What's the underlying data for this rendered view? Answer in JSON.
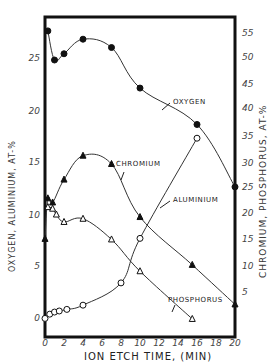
{
  "chart_data": {
    "type": "line",
    "title": "",
    "xlabel": "Ion Etch Time, (min)",
    "ylabel_left": "Oxygen, Aluminium, At-%",
    "ylabel_right": "Chromium, Phosphorus, At-%",
    "xlim": [
      0,
      20
    ],
    "ylim_left": [
      0,
      29
    ],
    "ylim_right": [
      0,
      57
    ],
    "x_ticks": [
      "0",
      "2",
      "4",
      "6",
      "8",
      "10",
      "12",
      "14",
      "16",
      "18",
      "20"
    ],
    "y_ticks_left": [
      "0",
      "5",
      "10",
      "15",
      "20",
      "25"
    ],
    "y_ticks_right": [
      "5",
      "10",
      "15",
      "20",
      "25",
      "30",
      "35",
      "40",
      "45",
      "50",
      "55"
    ],
    "grid": false,
    "legend": "inline labels",
    "series": [
      {
        "name": "Oxygen",
        "axis": "left",
        "marker": "filled-circle",
        "x": [
          0.3,
          1,
          2,
          4,
          7,
          10,
          16,
          20
        ],
        "y": [
          27.8,
          25.0,
          25.6,
          27.0,
          26.2,
          22.3,
          18.8,
          12.8
        ]
      },
      {
        "name": "Aluminium",
        "axis": "left",
        "marker": "filled-triangle",
        "x": [
          0,
          0.3,
          0.8,
          2,
          4,
          7,
          10,
          15.5,
          20
        ],
        "y": [
          7.8,
          11.7,
          11.3,
          13.5,
          15.8,
          15.0,
          9.9,
          5.3,
          1.5
        ]
      },
      {
        "name": "Chromium",
        "axis": "right",
        "marker": "open-triangle",
        "x": [
          0.3,
          0.8,
          1.2,
          2,
          4,
          7,
          10,
          15.5
        ],
        "y": [
          21.3,
          21.0,
          19.9,
          18.5,
          19.1,
          15.2,
          9.2,
          0.2
        ]
      },
      {
        "name": "Phosphorus",
        "axis": "right",
        "marker": "open-circle",
        "x": [
          0,
          0.5,
          1,
          1.5,
          2.3,
          4,
          8,
          10,
          16
        ],
        "y": [
          0.3,
          1.1,
          1.5,
          1.7,
          2.0,
          2.8,
          7.0,
          15.4,
          34.3
        ]
      }
    ],
    "annotations": [
      "Oxygen",
      "Chromium",
      "Aluminium",
      "Phosphorus"
    ]
  },
  "labels": {
    "oxygen": "OXYGEN",
    "chromium": "CHROMIUM",
    "aluminium": "ALUMINIUM",
    "phosphorus": "PHOSPHORUS",
    "xlabel": "ION ETCH TIME, (MIN)",
    "ylabel_left": "OXYGEN, ALUMINIUM, AT-%",
    "ylabel_right": "CHROMIUM, PHOSPHORUS, AT-%"
  },
  "ticks": {
    "x": [
      {
        "label": "0",
        "px": 45
      },
      {
        "label": "2",
        "px": 64
      },
      {
        "label": "4",
        "px": 83
      },
      {
        "label": "6",
        "px": 102
      },
      {
        "label": "8",
        "px": 121
      },
      {
        "label": "10",
        "px": 140
      },
      {
        "label": "12",
        "px": 159
      },
      {
        "label": "14",
        "px": 178
      },
      {
        "label": "16",
        "px": 197
      },
      {
        "label": "18",
        "px": 216
      },
      {
        "label": "20",
        "px": 235
      }
    ],
    "left": [
      {
        "label": "25",
        "py": 59
      },
      {
        "label": "20",
        "py": 112
      },
      {
        "label": "15",
        "py": 163
      },
      {
        "label": "10",
        "py": 216
      },
      {
        "label": "5",
        "py": 267
      },
      {
        "label": "0",
        "py": 319
      }
    ],
    "right": [
      {
        "label": "55",
        "py": 34
      },
      {
        "label": "50",
        "py": 58
      },
      {
        "label": "45",
        "py": 85
      },
      {
        "label": "40",
        "py": 109
      },
      {
        "label": "35",
        "py": 137
      },
      {
        "label": "30",
        "py": 164
      },
      {
        "label": "25",
        "py": 188
      },
      {
        "label": "20",
        "py": 214
      },
      {
        "label": "15",
        "py": 240
      },
      {
        "label": "10",
        "py": 267
      },
      {
        "label": "5",
        "py": 293
      }
    ]
  }
}
